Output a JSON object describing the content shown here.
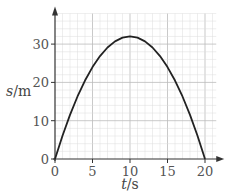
{
  "chart_data": {
    "type": "line",
    "title": "",
    "xlabel": "t/s",
    "xlabel_var": "t",
    "xlabel_unit": "s",
    "ylabel": "s/m",
    "ylabel_var": "s",
    "ylabel_unit": "m",
    "xlim": [
      0,
      21.5
    ],
    "ylim": [
      0,
      38
    ],
    "xticks": [
      0,
      5,
      10,
      15,
      20
    ],
    "yticks": [
      0,
      10,
      20,
      30
    ],
    "grid": true,
    "grid_minor_step": {
      "x": 1,
      "y": 2
    },
    "series": [
      {
        "name": "displacement",
        "description": "parabola s = 0.32 t (20 - t)",
        "x": [
          0,
          1,
          2,
          3,
          4,
          5,
          6,
          7,
          8,
          9,
          10,
          11,
          12,
          13,
          14,
          15,
          16,
          17,
          18,
          19,
          20
        ],
        "y": [
          0,
          6.08,
          11.52,
          16.32,
          20.48,
          24,
          26.88,
          29.12,
          30.72,
          31.68,
          32,
          31.68,
          30.72,
          29.12,
          26.88,
          24,
          20.48,
          16.32,
          11.52,
          6.08,
          0
        ],
        "color": "#222222"
      }
    ],
    "colors": {
      "grid_minor": "#dddddd",
      "grid_major": "#bbbbbb",
      "axis": "#333333"
    }
  }
}
